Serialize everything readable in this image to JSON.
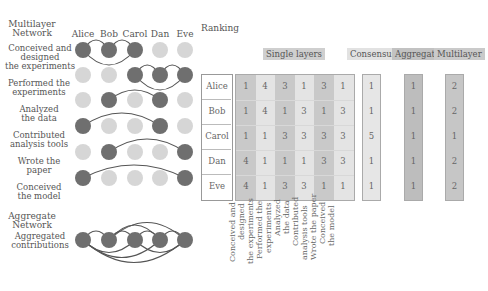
{
  "left": {
    "title_line1": "Multilayer",
    "title_line2": "Network",
    "people": [
      "Alice",
      "Bob",
      "Carol",
      "Dan",
      "Eve"
    ],
    "layers": [
      {
        "label": [
          "Conceived and",
          "designed",
          "the experiments"
        ],
        "active": [
          1,
          1,
          1,
          0,
          0
        ]
      },
      {
        "label": [
          "Performed the",
          "experiments"
        ],
        "active": [
          0,
          0,
          1,
          1,
          1
        ]
      },
      {
        "label": [
          "Analyzed",
          "the data"
        ],
        "active": [
          0,
          1,
          0,
          1,
          0
        ]
      },
      {
        "label": [
          "Contributed",
          "analysis tools"
        ],
        "active": [
          1,
          0,
          0,
          1,
          0
        ]
      },
      {
        "label": [
          "Wrote the",
          "paper"
        ],
        "active": [
          0,
          1,
          0,
          0,
          1
        ]
      },
      {
        "label": [
          "Conceived",
          "the model"
        ],
        "active": [
          1,
          0,
          0,
          0,
          1
        ]
      }
    ],
    "aggregate_title_line1": "Aggregate",
    "aggregate_title_line2": "Network",
    "aggregate_label_line1": "Aggregated",
    "aggregate_label_line2": "contributions"
  },
  "ranking": {
    "title": "Ranking",
    "band_single": "Single layers",
    "band_consensus": "Consensus",
    "band_aggregate": "Aggregate",
    "band_multilayer": "Multilayer",
    "rows": [
      "Alice",
      "Bob",
      "Carol",
      "Dan",
      "Eve"
    ],
    "single_layers": [
      [
        1,
        4,
        3,
        1,
        3,
        1
      ],
      [
        1,
        4,
        1,
        3,
        1,
        3
      ],
      [
        1,
        1,
        3,
        3,
        3,
        3
      ],
      [
        4,
        1,
        1,
        1,
        3,
        3
      ],
      [
        4,
        1,
        3,
        3,
        1,
        1
      ]
    ],
    "consensus": [
      1,
      1,
      5,
      1,
      1
    ],
    "aggregate": [
      1,
      1,
      1,
      1,
      1
    ],
    "multilayer": [
      2,
      2,
      1,
      2,
      2
    ],
    "column_labels": [
      [
        "Conceived and",
        "designed",
        "the experiments"
      ],
      [
        "Performed the",
        "experiments"
      ],
      [
        "Analyzed",
        "the data"
      ],
      [
        "Contributed",
        "analysis tools"
      ],
      [
        "Wrote the paper"
      ],
      [
        "Conceived",
        "the model"
      ]
    ]
  },
  "colors": {
    "node_active": "#6f6f6f",
    "node_inactive": "#d6d6d6",
    "edge": "#555555",
    "band_bg": "#cfcfcf",
    "col_dark": "#c9c9c9",
    "col_light": "#e4e4e4",
    "aggregate_col": "#bdbdbd",
    "multilayer_col": "#c6c6c6",
    "consensus_col": "#e6e6e6"
  }
}
